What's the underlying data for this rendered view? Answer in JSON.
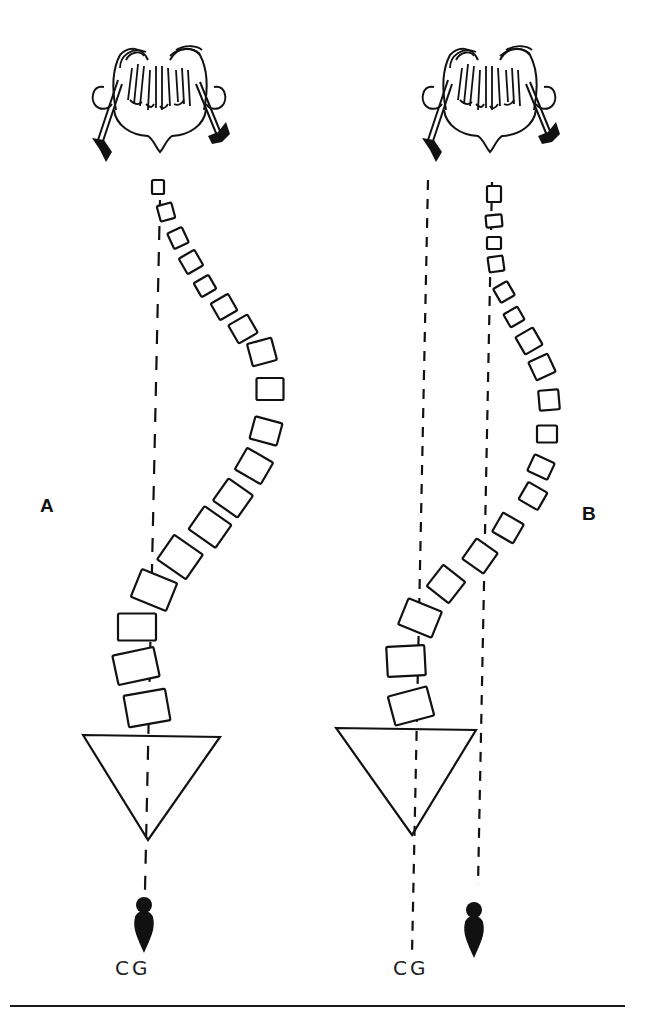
{
  "figure": {
    "panels": [
      {
        "id": "A",
        "label": "A",
        "label_pos": {
          "x": 40,
          "y": 505
        },
        "cg_label": "CG",
        "cg_label_pos": {
          "x": 115,
          "y": 968
        },
        "plumb_lines": [
          {
            "x1": 160,
            "y1": 200,
            "x2": 145,
            "y2": 890
          }
        ],
        "pelvis": {
          "points": "83,735 220,737 148,840"
        },
        "bob": {
          "x": 144,
          "y": 895
        },
        "skull": {
          "x": 90,
          "y": 40
        },
        "vertebrae": [
          {
            "x": 158,
            "y": 187,
            "w": 12,
            "h": 14,
            "r": 0
          },
          {
            "x": 166,
            "y": 212,
            "w": 15,
            "h": 16,
            "r": -15
          },
          {
            "x": 178,
            "y": 238,
            "w": 16,
            "h": 17,
            "r": -25
          },
          {
            "x": 191,
            "y": 262,
            "w": 18,
            "h": 18,
            "r": -30
          },
          {
            "x": 205,
            "y": 286,
            "w": 17,
            "h": 16,
            "r": -30
          },
          {
            "x": 224,
            "y": 307,
            "w": 20,
            "h": 19,
            "r": -30
          },
          {
            "x": 243,
            "y": 329,
            "w": 22,
            "h": 21,
            "r": -30
          },
          {
            "x": 262,
            "y": 352,
            "w": 25,
            "h": 23,
            "r": -15
          },
          {
            "x": 270,
            "y": 389,
            "w": 27,
            "h": 22,
            "r": 0
          },
          {
            "x": 266,
            "y": 431,
            "w": 28,
            "h": 23,
            "r": 15
          },
          {
            "x": 254,
            "y": 466,
            "w": 30,
            "h": 25,
            "r": 30
          },
          {
            "x": 233,
            "y": 498,
            "w": 30,
            "h": 27,
            "r": 35
          },
          {
            "x": 210,
            "y": 527,
            "w": 33,
            "h": 28,
            "r": 35
          },
          {
            "x": 180,
            "y": 557,
            "w": 35,
            "h": 30,
            "r": 35
          },
          {
            "x": 154,
            "y": 590,
            "w": 38,
            "h": 30,
            "r": 22
          },
          {
            "x": 137,
            "y": 627,
            "w": 38,
            "h": 27,
            "r": 0
          },
          {
            "x": 136,
            "y": 666,
            "w": 42,
            "h": 30,
            "r": -12
          },
          {
            "x": 147,
            "y": 708,
            "w": 42,
            "h": 32,
            "r": -10
          }
        ]
      },
      {
        "id": "B",
        "label": "B",
        "label_pos": {
          "x": 582,
          "y": 513
        },
        "cg_label": "CG",
        "cg_label_pos": {
          "x": 393,
          "y": 968
        },
        "plumb_lines": [
          {
            "x1": 428,
            "y1": 180,
            "x2": 412,
            "y2": 955
          },
          {
            "x1": 492,
            "y1": 182,
            "x2": 478,
            "y2": 885
          }
        ],
        "pelvis": {
          "points": "336,728 476,730 412,835"
        },
        "bob": {
          "x": 474,
          "y": 900
        },
        "skull": {
          "x": 420,
          "y": 40
        },
        "vertebrae": [
          {
            "x": 494,
            "y": 194,
            "w": 14,
            "h": 16,
            "r": 0
          },
          {
            "x": 494,
            "y": 221,
            "w": 16,
            "h": 12,
            "r": -5
          },
          {
            "x": 494,
            "y": 243,
            "w": 14,
            "h": 12,
            "r": 0
          },
          {
            "x": 496,
            "y": 264,
            "w": 15,
            "h": 15,
            "r": -8
          },
          {
            "x": 504,
            "y": 292,
            "w": 16,
            "h": 16,
            "r": -30
          },
          {
            "x": 514,
            "y": 317,
            "w": 16,
            "h": 15,
            "r": -30
          },
          {
            "x": 529,
            "y": 341,
            "w": 20,
            "h": 20,
            "r": -30
          },
          {
            "x": 542,
            "y": 367,
            "w": 21,
            "h": 20,
            "r": -25
          },
          {
            "x": 549,
            "y": 400,
            "w": 20,
            "h": 20,
            "r": -5
          },
          {
            "x": 547,
            "y": 434,
            "w": 20,
            "h": 17,
            "r": 0
          },
          {
            "x": 541,
            "y": 467,
            "w": 22,
            "h": 18,
            "r": 25
          },
          {
            "x": 533,
            "y": 496,
            "w": 22,
            "h": 20,
            "r": 30
          },
          {
            "x": 508,
            "y": 528,
            "w": 24,
            "h": 22,
            "r": 30
          },
          {
            "x": 480,
            "y": 556,
            "w": 26,
            "h": 25,
            "r": 35
          },
          {
            "x": 446,
            "y": 584,
            "w": 28,
            "h": 27,
            "r": 38
          },
          {
            "x": 420,
            "y": 618,
            "w": 36,
            "h": 28,
            "r": 22
          },
          {
            "x": 406,
            "y": 661,
            "w": 38,
            "h": 30,
            "r": -3
          },
          {
            "x": 411,
            "y": 706,
            "w": 40,
            "h": 30,
            "r": -15
          }
        ]
      }
    ]
  },
  "colors": {
    "ink": "#111111",
    "paper": "#ffffff"
  }
}
